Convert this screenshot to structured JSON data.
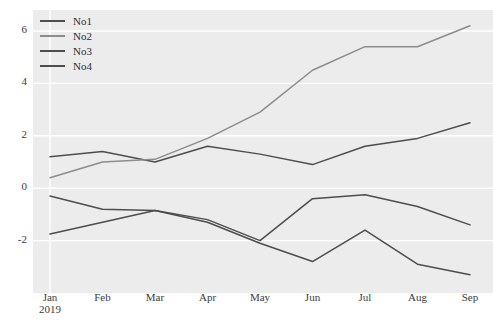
{
  "chart_data": {
    "type": "line",
    "title": "",
    "xlabel": "",
    "ylabel": "",
    "grid": true,
    "legend_position": "top-left",
    "plot_background": "#ececec",
    "gridline_color": "#ffffff",
    "x": [
      "Jan\n2019",
      "Feb",
      "Mar",
      "Apr",
      "May",
      "Jun",
      "Jul",
      "Aug",
      "Sep"
    ],
    "categories": [
      "Jan 2019",
      "Feb",
      "Mar",
      "Apr",
      "May",
      "Jun",
      "Jul",
      "Aug",
      "Sep"
    ],
    "xtick_labels": [
      "Jan",
      "Feb",
      "Mar",
      "Apr",
      "May",
      "Jun",
      "Jul",
      "Aug",
      "Sep"
    ],
    "xtick_sublabel": "2019",
    "ytick_labels": [
      "6",
      "4",
      "2",
      "0",
      "-2"
    ],
    "ytick_values": [
      6,
      4,
      2,
      0,
      -2
    ],
    "ylim": [
      -4.0,
      6.8
    ],
    "xlim": [
      0,
      8
    ],
    "series": [
      {
        "name": "No1",
        "color": "#4d4d4d",
        "values": [
          1.2,
          1.4,
          1.0,
          1.6,
          1.3,
          0.9,
          1.6,
          1.9,
          2.5
        ]
      },
      {
        "name": "No2",
        "color": "#8c8c8c",
        "values": [
          0.4,
          1.0,
          1.1,
          1.9,
          2.9,
          4.5,
          5.4,
          5.4,
          6.2
        ]
      },
      {
        "name": "No3",
        "color": "#4d4d4d",
        "values": [
          -0.3,
          -0.8,
          -0.85,
          -1.2,
          -2.0,
          -0.4,
          -0.25,
          -0.7,
          -1.4
        ]
      },
      {
        "name": "No4",
        "color": "#4d4d4d",
        "values": [
          -1.75,
          -1.3,
          -0.85,
          -1.3,
          -2.1,
          -2.8,
          -1.6,
          -2.9,
          -3.3
        ]
      }
    ]
  }
}
